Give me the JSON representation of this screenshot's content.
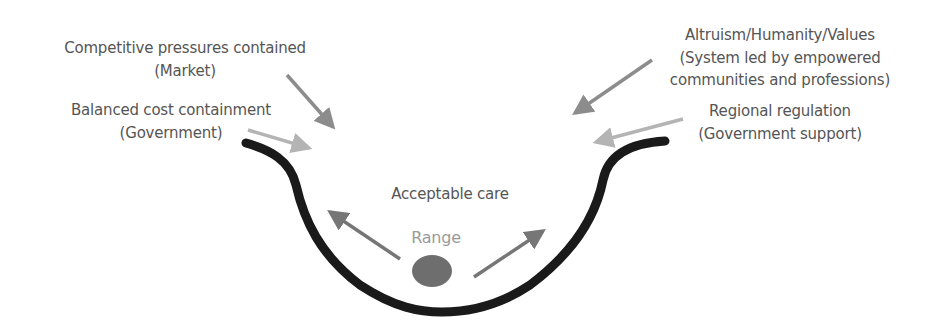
{
  "diagram": {
    "forces_left": [
      {
        "lines": [
          "Competitive pressures contained",
          "(Market)"
        ],
        "arrow_color": "#8c8c8c"
      },
      {
        "lines": [
          "Balanced cost containment",
          "(Government)"
        ],
        "arrow_color": "#b4b4b4"
      }
    ],
    "forces_right": [
      {
        "lines": [
          "Altruism/Humanity/Values",
          "(System led by empowered",
          "communities and professions)"
        ],
        "arrow_color": "#8c8c8c"
      },
      {
        "lines": [
          "Regional regulation",
          "(Government support)"
        ],
        "arrow_color": "#b4b4b4"
      }
    ],
    "center": {
      "label": "Acceptable care",
      "range_label": "Range",
      "ball_color": "#6e6e6e",
      "range_arrow_color": "#767676"
    },
    "bowl_color": "#1a1a1a",
    "text_color": "#555555"
  }
}
